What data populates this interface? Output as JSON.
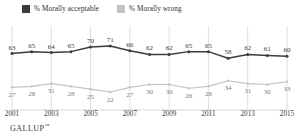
{
  "legend": {
    "items": [
      {
        "label": "% Morally acceptable",
        "color": "#3c3c3c",
        "icon": "square-swatch-dark"
      },
      {
        "label": "% Morally wrong",
        "color": "#c3c3c3",
        "icon": "square-swatch-light"
      }
    ]
  },
  "footer": {
    "brand": "GALLUP",
    "trademark": "™"
  },
  "chart_data": {
    "type": "line",
    "title": "",
    "xlabel": "",
    "ylabel": "",
    "ylim": [
      0,
      100
    ],
    "grid": "vertical",
    "legend_position": "top-left",
    "x": [
      2001,
      2002,
      2003,
      2004,
      2005,
      2006,
      2007,
      2008,
      2009,
      2010,
      2011,
      2012,
      2013,
      2014,
      2015
    ],
    "tick_labels": [
      "2001",
      "2003",
      "2005",
      "2007",
      "2009",
      "2011",
      "2013",
      "2015"
    ],
    "tick_values": [
      2001,
      2003,
      2005,
      2007,
      2009,
      2011,
      2013,
      2015
    ],
    "series": [
      {
        "name": "% Morally acceptable",
        "color": "#3c3c3c",
        "values": [
          63,
          65,
          64,
          65,
          70,
          71,
          66,
          62,
          62,
          65,
          65,
          58,
          62,
          61,
          60
        ]
      },
      {
        "name": "% Morally wrong",
        "color": "#c3c3c3",
        "values": [
          27,
          28,
          31,
          28,
          25,
          22,
          27,
          30,
          30,
          26,
          28,
          34,
          31,
          30,
          33
        ]
      }
    ]
  }
}
